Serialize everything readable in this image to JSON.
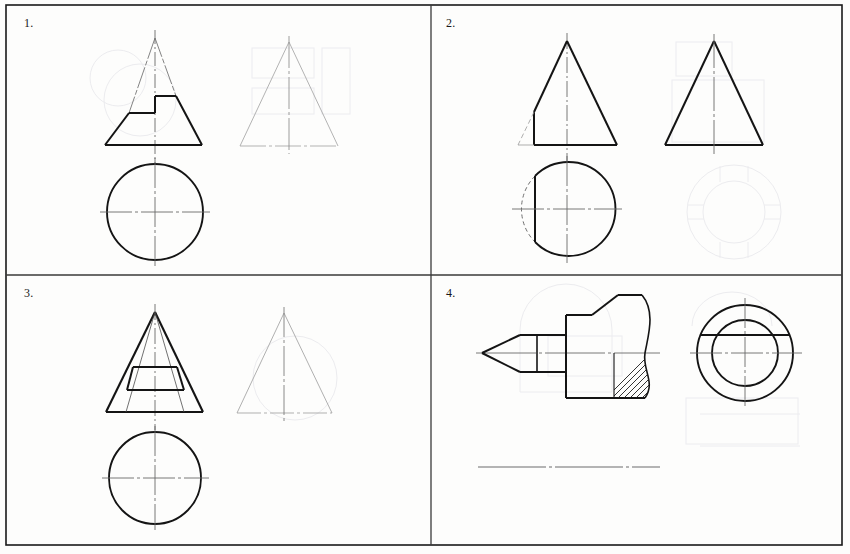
{
  "sheet": {
    "title": "Technical Drawing Exercise Sheet",
    "width": 850,
    "height": 554,
    "background_color": "#fdfdfc",
    "border": {
      "color": "#1a1a1a",
      "x": 6,
      "y": 5,
      "width": 836,
      "height": 540,
      "stroke_width": 1.6
    },
    "dividers": {
      "vertical_x": 431,
      "horizontal_y": 275,
      "color": "#3a3a3a",
      "stroke_width": 1.3
    },
    "line_colors": {
      "thick": "#141414",
      "thin": "#3c3c3c",
      "faint": "#9a9a9a",
      "ghost": "#e9e9ec",
      "center": "#6a6a6a"
    },
    "line_widths": {
      "thick": 2.0,
      "medium": 1.3,
      "thin": 0.8,
      "center": 0.8
    }
  },
  "quadrants": [
    {
      "id": 1,
      "label": "1.",
      "description": "Truncated cone (frustum) front view with stepped cut, plus faint auxiliary triangle view and circular top view",
      "views": {
        "front": {
          "name": "front-view-frustum-stepped",
          "apex_x": 155,
          "apex_y": 38,
          "base_y": 145,
          "base_left_x": 105,
          "base_right_x": 202,
          "step": {
            "inner_left_x": 129,
            "inner_mid_x": 155,
            "upper_right_x": 176,
            "lower_shelf_y": 113,
            "upper_shelf_y": 96
          }
        },
        "aux": {
          "name": "auxiliary-view-triangle-faint",
          "apex_x": 289,
          "apex_y": 42,
          "base_y": 146,
          "base_left_x": 240,
          "base_right_x": 338
        },
        "top": {
          "name": "top-view-circle",
          "cx": 155,
          "cy": 212,
          "r": 48
        }
      }
    },
    {
      "id": 2,
      "label": "2.",
      "description": "Cone front view with vertical plane cut on left side, matching circular top view with chord, and faint ghost auxiliary views",
      "views": {
        "front": {
          "name": "front-view-cone-cut",
          "apex_x": 567,
          "apex_y": 41,
          "base_y": 145,
          "base_left_x": 518,
          "base_right_x": 617,
          "cut_x": 534,
          "cut_top_y": 112
        },
        "side": {
          "name": "side-view-triangle",
          "apex_x": 714,
          "apex_y": 41,
          "base_y": 145,
          "base_left_x": 665,
          "base_right_x": 763
        },
        "top": {
          "name": "top-view-circle-with-chord",
          "cx": 567,
          "cy": 209,
          "r": 47,
          "chord_x": 535
        },
        "ghost": {
          "name": "ghost-annulus",
          "cx": 734,
          "cy": 212,
          "r_outer": 47,
          "r_inner": 31
        }
      }
    },
    {
      "id": 3,
      "label": "3.",
      "description": "Pyramid/cone front view with nested inner cone outline and trapezoidal cut, faint auxiliary triangle, circular top view",
      "views": {
        "front": {
          "name": "front-view-nested-frustum",
          "apex_x": 155,
          "apex_y": 312,
          "base_y": 412,
          "base_left_x": 106,
          "base_right_x": 203,
          "inner_base_left_x": 126,
          "inner_base_right_x": 184,
          "trapezoid": {
            "top_left_x": 133,
            "top_right_x": 177,
            "top_y": 367,
            "bottom_left_x": 127,
            "bottom_right_x": 184,
            "bottom_y": 390
          }
        },
        "aux": {
          "name": "auxiliary-view-triangle-faint",
          "apex_x": 284,
          "apex_y": 313,
          "base_y": 413,
          "base_left_x": 237,
          "base_right_x": 332
        },
        "top": {
          "name": "top-view-circle",
          "cx": 155,
          "cy": 478,
          "r": 46
        }
      }
    },
    {
      "id": 4,
      "label": "4.",
      "description": "Pointed shaft / punch with chamfered conical tip, collar, flat, and broken-out hatched section; end view shows concentric circles with chord",
      "views": {
        "front": {
          "name": "front-view-pointed-shaft",
          "axis_y": 353,
          "tip_x": 482,
          "cone_base_x": 520,
          "body_top_y": 335,
          "body_bottom_y": 372,
          "collar_x1": 537,
          "collar_x2": 566,
          "flat_top_y": 315,
          "flat_bottom_y": 398,
          "shoulder_x": 618,
          "upper_step_y": 308,
          "break_x": 644,
          "hatch_lines": 7
        },
        "end": {
          "name": "end-view-concentric-circles",
          "cx": 745,
          "cy": 353,
          "r_outer": 48,
          "r_inner": 33,
          "chord_y": 335
        },
        "baseline": {
          "name": "construction-baseline",
          "x1": 478,
          "x2": 660,
          "y": 467
        }
      }
    }
  ]
}
